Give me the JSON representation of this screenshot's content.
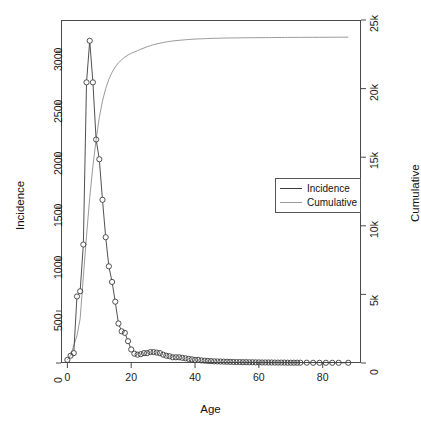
{
  "chart_data": {
    "type": "line",
    "title": "",
    "xlabel": "Age",
    "ylabel": "Incidence",
    "y2label": "Cumulative",
    "xlim": [
      -2,
      92
    ],
    "ylim": [
      0,
      3300
    ],
    "y2lim": [
      0,
      25000
    ],
    "grid": false,
    "legend_position": "center-right",
    "xticks": [
      0,
      20,
      40,
      60,
      80
    ],
    "xticklabels": [
      "0",
      "20",
      "40",
      "60",
      "80"
    ],
    "yticks": [
      0,
      500,
      1000,
      1500,
      2000,
      2500,
      3000
    ],
    "yticklabels": [
      "0",
      "500",
      "1000",
      "1500",
      "2000",
      "2500",
      "3000"
    ],
    "y2ticks": [
      0,
      5000,
      10000,
      15000,
      20000,
      25000
    ],
    "y2ticklabels": [
      "0",
      "5k",
      "10k",
      "15k",
      "20k",
      "25k"
    ],
    "legend": [
      {
        "name": "Incidence",
        "color": "#3c3c3c",
        "marker": "circle-open"
      },
      {
        "name": "Cumulative",
        "color": "#9a9a9a",
        "marker": "none"
      }
    ],
    "x": [
      0,
      1,
      2,
      3,
      4,
      5,
      6,
      7,
      8,
      9,
      10,
      11,
      12,
      13,
      14,
      15,
      16,
      17,
      18,
      19,
      20,
      21,
      22,
      23,
      24,
      25,
      26,
      27,
      28,
      29,
      30,
      31,
      32,
      33,
      34,
      35,
      36,
      37,
      38,
      39,
      40,
      41,
      42,
      43,
      44,
      45,
      46,
      47,
      48,
      49,
      50,
      51,
      52,
      53,
      54,
      55,
      56,
      57,
      58,
      59,
      60,
      61,
      62,
      63,
      64,
      65,
      66,
      67,
      68,
      69,
      70,
      71,
      72,
      73,
      75,
      77,
      79,
      81,
      83,
      85,
      88
    ],
    "series": [
      {
        "name": "Incidence",
        "axis": "left",
        "color": "#3c3c3c",
        "values": [
          30,
          70,
          95,
          640,
          690,
          1140,
          2700,
          3100,
          2700,
          2150,
          1960,
          1570,
          1210,
          930,
          780,
          590,
          380,
          305,
          290,
          210,
          130,
          90,
          80,
          85,
          95,
          95,
          105,
          105,
          100,
          95,
          80,
          70,
          65,
          55,
          55,
          55,
          50,
          45,
          40,
          35,
          30,
          30,
          25,
          22,
          20,
          18,
          16,
          15,
          14,
          13,
          12,
          11,
          10,
          9,
          9,
          8,
          8,
          7,
          7,
          6,
          6,
          5,
          5,
          5,
          5,
          4,
          4,
          4,
          4,
          3,
          3,
          3,
          3,
          3,
          3,
          2,
          2,
          2,
          2,
          2,
          2
        ]
      },
      {
        "name": "Cumulative",
        "axis": "right",
        "color": "#9a9a9a",
        "values": [
          230,
          540,
          1270,
          1980,
          3230,
          6280,
          9270,
          12050,
          14350,
          16280,
          17900,
          19100,
          20000,
          20680,
          21180,
          21580,
          21880,
          22100,
          22300,
          22450,
          22570,
          22670,
          22770,
          22870,
          22960,
          23050,
          23130,
          23200,
          23260,
          23310,
          23360,
          23400,
          23440,
          23470,
          23500,
          23520,
          23540,
          23560,
          23580,
          23595,
          23610,
          23620,
          23630,
          23640,
          23650,
          23658,
          23664,
          23670,
          23676,
          23681,
          23685,
          23689,
          23693,
          23696,
          23699,
          23702,
          23705,
          23707,
          23709,
          23711,
          23713,
          23715,
          23717,
          23719,
          23721,
          23723,
          23725,
          23727,
          23729,
          23730,
          23731,
          23732,
          23733,
          23734,
          23736,
          23738,
          23740,
          23742,
          23744,
          23746,
          23750
        ]
      }
    ]
  },
  "axes": {
    "x_title": "Age",
    "y_title": "Incidence",
    "y2_title": "Cumulative"
  }
}
